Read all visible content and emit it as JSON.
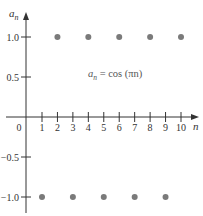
{
  "chart_data": {
    "type": "scatter",
    "title": "",
    "annotation": "a_n = cos (πn)",
    "annotation_parts": {
      "lhs": "a",
      "sub": "n",
      "rhs": "= cos (πn)"
    },
    "xlabel": "n",
    "ylabel": "a",
    "ylabel_sub": "n",
    "x_ticks": [
      1,
      2,
      3,
      4,
      5,
      6,
      7,
      8,
      9,
      10
    ],
    "y_ticks": [
      1.0,
      0.5,
      -0.5,
      -1.0
    ],
    "y_tick_labels": [
      "1.0",
      "0.5",
      "−0.5",
      "−1.0"
    ],
    "origin_label": "0",
    "xlim": [
      0,
      10.5
    ],
    "ylim": [
      -1.1,
      1.2
    ],
    "grid": false,
    "legend": null,
    "series": [
      {
        "name": "a_n = cos(πn)",
        "x": [
          1,
          2,
          3,
          4,
          5,
          6,
          7,
          8,
          9,
          10
        ],
        "y": [
          -1,
          1,
          -1,
          1,
          -1,
          1,
          -1,
          1,
          -1,
          1
        ]
      }
    ],
    "colors": {
      "axis": "#333333",
      "points": "#7a7a7a"
    }
  }
}
